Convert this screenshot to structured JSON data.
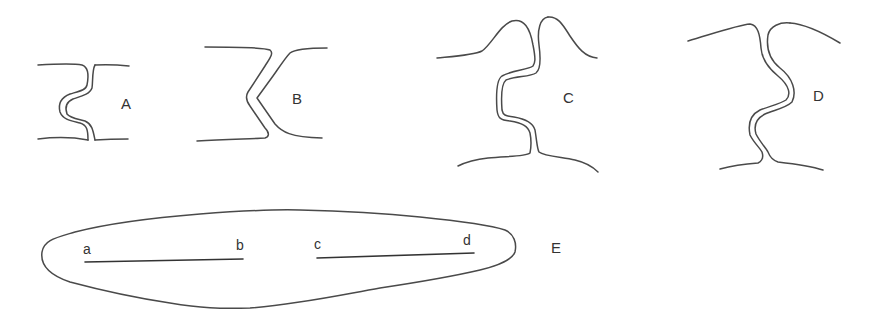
{
  "figure": {
    "panels": [
      {
        "id": "A",
        "label": "A",
        "description": "straight walls joined by a double-lined S-shaped bulge (pronounced hook)"
      },
      {
        "id": "B",
        "label": "B",
        "description": "walls joined by a double-lined V/angled isthmus"
      },
      {
        "id": "C",
        "label": "C",
        "description": "two-humped upper outline with a double-lined S-shaped isthmus"
      },
      {
        "id": "D",
        "label": "D",
        "description": "broad arched outline with a double-lined wavy sinuous isthmus"
      },
      {
        "id": "E",
        "label": "E",
        "description": "elongated lanceolate outline with two internal line segments"
      }
    ],
    "panel_e": {
      "segment_1": {
        "start_label": "a",
        "end_label": "b"
      },
      "segment_2": {
        "start_label": "c",
        "end_label": "d"
      }
    },
    "colors": {
      "line": "#4a4a4a",
      "background": "#ffffff"
    }
  }
}
